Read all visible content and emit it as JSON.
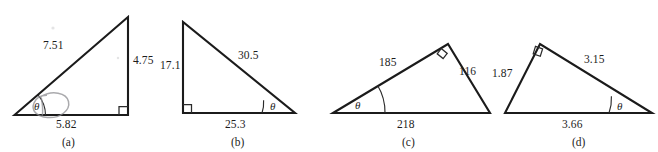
{
  "figure": {
    "theta_symbol": "θ",
    "stroke_color": "#1b1b1b",
    "background_color": "#ffffff",
    "artifact_color": "#8d8d92"
  },
  "triangles": [
    {
      "id": "a",
      "caption": "(a)",
      "right_angle_vertex": "bottom-right",
      "theta_vertex": "bottom-left",
      "labels": {
        "hypotenuse": "7.51",
        "vertical": "4.75",
        "base": "5.82"
      }
    },
    {
      "id": "b",
      "caption": "(b)",
      "right_angle_vertex": "bottom-left",
      "theta_vertex": "bottom-right",
      "labels": {
        "vertical": "17.1",
        "hypotenuse": "30.5",
        "base": "25.3"
      }
    },
    {
      "id": "c",
      "caption": "(c)",
      "right_angle_vertex": "apex",
      "theta_vertex": "bottom-left",
      "labels": {
        "left_side": "185",
        "right_side": "116",
        "base": "218"
      }
    },
    {
      "id": "d",
      "caption": "(d)",
      "right_angle_vertex": "apex",
      "theta_vertex": "bottom-right",
      "labels": {
        "left_side": "1.87",
        "right_side": "3.15",
        "base": "3.66"
      }
    }
  ]
}
